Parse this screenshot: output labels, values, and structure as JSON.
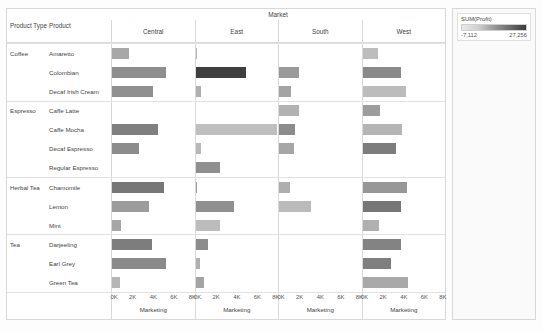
{
  "viz": {
    "market_header": "Market",
    "headers": {
      "product_type": "Product Type",
      "product": "Product"
    },
    "markets": [
      "Central",
      "East",
      "South",
      "West"
    ],
    "axis": {
      "title": "Marketing",
      "ticks": [
        "0K",
        "2K",
        "4K",
        "6K",
        "8K"
      ],
      "max": 8000
    }
  },
  "legend": {
    "title": "SUM(Profit)",
    "min": "-7,112",
    "max": "27,256",
    "ramp_light": "#e9e9e9",
    "ramp_dark": "#3a3a3a"
  },
  "chart_data": {
    "type": "bar",
    "xlabel": "Marketing",
    "ylabel": "Product",
    "xlim": [
      0,
      8000
    ],
    "grid": false,
    "legend_position": "right",
    "color_measure": "SUM(Profit)",
    "color_range": [
      -7112,
      27256
    ],
    "categories": [
      "Central",
      "East",
      "South",
      "West"
    ],
    "rows": [
      {
        "product_type": "Coffee",
        "product": "Amaretto",
        "group_start": true,
        "values": [
          1650,
          170,
          0,
          1550
        ],
        "colors": [
          "#a8a8a8",
          "#b4b4b4",
          null,
          "#bdbdbd"
        ]
      },
      {
        "product_type": "",
        "product": "Colombian",
        "group_start": false,
        "values": [
          5200,
          4900,
          1980,
          3700
        ],
        "colors": [
          "#8e8e8e",
          "#3f3f3f",
          "#9a9a9a",
          "#8a8a8a"
        ]
      },
      {
        "product_type": "",
        "product": "Decaf Irish Cream",
        "group_start": false,
        "values": [
          3950,
          560,
          1160,
          4250
        ],
        "colors": [
          "#909090",
          "#b0b0b0",
          "#a4a4a4",
          "#bcbcbc"
        ]
      },
      {
        "product_type": "Espresso",
        "product": "Caffe Latte",
        "group_start": true,
        "values": [
          0,
          0,
          1950,
          1700
        ],
        "colors": [
          null,
          null,
          "#b2b2b2",
          "#9d9d9d"
        ]
      },
      {
        "product_type": "",
        "product": "Caffe Mocha",
        "group_start": false,
        "values": [
          4450,
          7900,
          1540,
          3850
        ],
        "colors": [
          "#7f7f7f",
          "#bfbfbf",
          "#8c8c8c",
          "#b5b5b5"
        ]
      },
      {
        "product_type": "",
        "product": "Decaf Espresso",
        "group_start": false,
        "values": [
          2650,
          560,
          1430,
          3200
        ],
        "colors": [
          "#8c8c8c",
          "#b8b8b8",
          "#a6a6a6",
          "#7d7d7d"
        ]
      },
      {
        "product_type": "",
        "product": "Regular Espresso",
        "group_start": false,
        "values": [
          0,
          2350,
          0,
          0
        ],
        "colors": [
          null,
          "#8f8f8f",
          null,
          null
        ]
      },
      {
        "product_type": "Herbal Tea",
        "product": "Chamomile",
        "group_start": true,
        "values": [
          5050,
          130,
          1100,
          4350
        ],
        "colors": [
          "#777777",
          "#9d9d9d",
          "#aeaeae",
          "#979797"
        ]
      },
      {
        "product_type": "",
        "product": "Lemon",
        "group_start": false,
        "values": [
          3550,
          3700,
          3100,
          3750
        ],
        "colors": [
          "#9c9c9c",
          "#909090",
          "#bbbbbb",
          "#767676"
        ]
      },
      {
        "product_type": "",
        "product": "Mint",
        "group_start": false,
        "values": [
          880,
          2350,
          0,
          1600
        ],
        "colors": [
          "#a6a6a6",
          "#bcbcbc",
          null,
          "#b0b0b0"
        ]
      },
      {
        "product_type": "Tea",
        "product": "Darjeeling",
        "group_start": true,
        "values": [
          3900,
          1180,
          0,
          3750
        ],
        "colors": [
          "#7d7d7d",
          "#8d8d8d",
          null,
          "#838383"
        ]
      },
      {
        "product_type": "",
        "product": "Earl Grey",
        "group_start": false,
        "values": [
          5250,
          430,
          0,
          2800
        ],
        "colors": [
          "#8a8a8a",
          "#b0b0b0",
          null,
          "#7f7f7f"
        ]
      },
      {
        "product_type": "",
        "product": "Green Tea",
        "group_start": false,
        "values": [
          780,
          800,
          0,
          4400
        ],
        "colors": [
          "#b6b6b6",
          "#a4a4a4",
          null,
          "#a9a9a9"
        ]
      }
    ]
  }
}
